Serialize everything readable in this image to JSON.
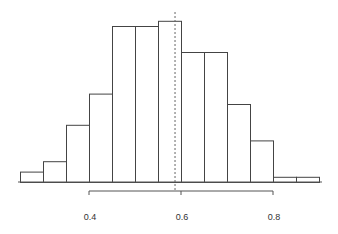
{
  "chart_data": {
    "type": "histogram",
    "title": "",
    "xlabel": "",
    "ylabel": "",
    "bin_edges": [
      0.25,
      0.3,
      0.35,
      0.4,
      0.45,
      0.5,
      0.55,
      0.6,
      0.65,
      0.7,
      0.75,
      0.8,
      0.85,
      0.9
    ],
    "categories": [
      "0.25-0.30",
      "0.30-0.35",
      "0.35-0.40",
      "0.40-0.45",
      "0.45-0.50",
      "0.50-0.55",
      "0.55-0.60",
      "0.60-0.65",
      "0.65-0.70",
      "0.70-0.75",
      "0.75-0.80",
      "0.80-0.85",
      "0.85-0.90"
    ],
    "values": [
      2,
      4,
      11,
      17,
      30,
      30,
      31,
      25,
      25,
      15,
      8,
      1,
      1
    ],
    "reference_line": {
      "x": 0.587,
      "style": "dotted"
    },
    "x_ticks": [
      0.4,
      0.6,
      0.8
    ],
    "x_tick_labels": [
      "0.4",
      "0.6",
      "0.8"
    ],
    "xlim": [
      0.25,
      0.9
    ],
    "ylim": [
      0,
      31
    ],
    "axis_range_bracket": [
      0.4,
      0.8
    ],
    "grid": false,
    "legend": null,
    "y_axis_shown": false
  },
  "colors": {
    "bar_fill": "#ffffff",
    "bar_stroke": "#444444",
    "axis": "#555555",
    "reference_line": "#666666",
    "text": "#333333"
  }
}
